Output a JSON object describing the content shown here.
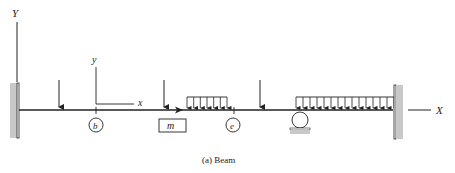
{
  "figure": {
    "caption": "(a) Beam",
    "global_axes": {
      "y_label": "Y",
      "x_label": "X"
    },
    "local_axes": {
      "y_label": "y",
      "x_label": "x"
    },
    "node_labels": {
      "b": "b",
      "e": "e"
    },
    "mass_label": "m",
    "supports": [
      "fixed-wall-left",
      "roller-support",
      "fixed-wall-right"
    ],
    "loads": {
      "point_loads": 3,
      "distributed_loads": [
        {
          "arrows": 7
        },
        {
          "arrows": 15
        }
      ]
    },
    "colors": {
      "line": "#222222",
      "wall_fill": "#c8c8c8",
      "text": "#222222"
    }
  }
}
